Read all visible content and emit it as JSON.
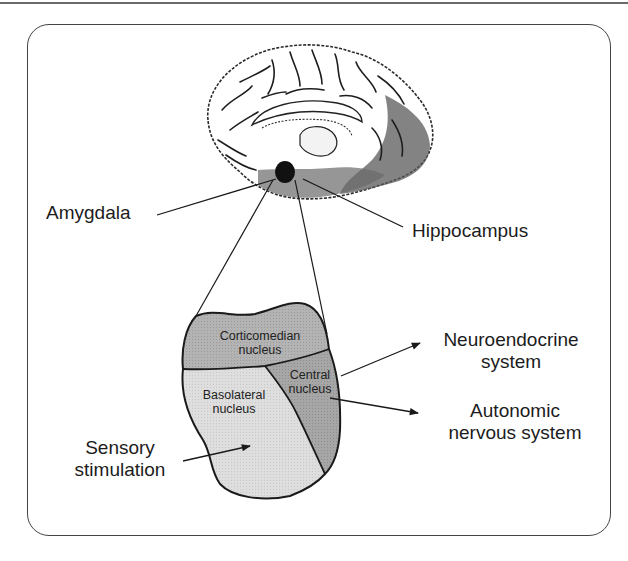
{
  "figure": {
    "colors": {
      "frame": "#444444",
      "line": "#222222",
      "corticomedian_fill": "#b3b3b3",
      "central_fill": "#a8a8a8",
      "basolateral_fill": "#dcdcdc",
      "amygdala_spot": "#111111"
    }
  },
  "labels": {
    "amygdala": "Amygdala",
    "hippocampus": "Hippocampus",
    "neuroendocrine_line1": "Neuroendocrine",
    "neuroendocrine_line2": "system",
    "autonomic_line1": "Autonomic",
    "autonomic_line2": "nervous system",
    "sensory_line1": "Sensory",
    "sensory_line2": "stimulation"
  },
  "nuclei": {
    "corticomedian_line1": "Corticomedian",
    "corticomedian_line2": "nucleus",
    "central_line1": "Central",
    "central_line2": "nucleus",
    "basolateral_line1": "Basolateral",
    "basolateral_line2": "nucleus"
  }
}
